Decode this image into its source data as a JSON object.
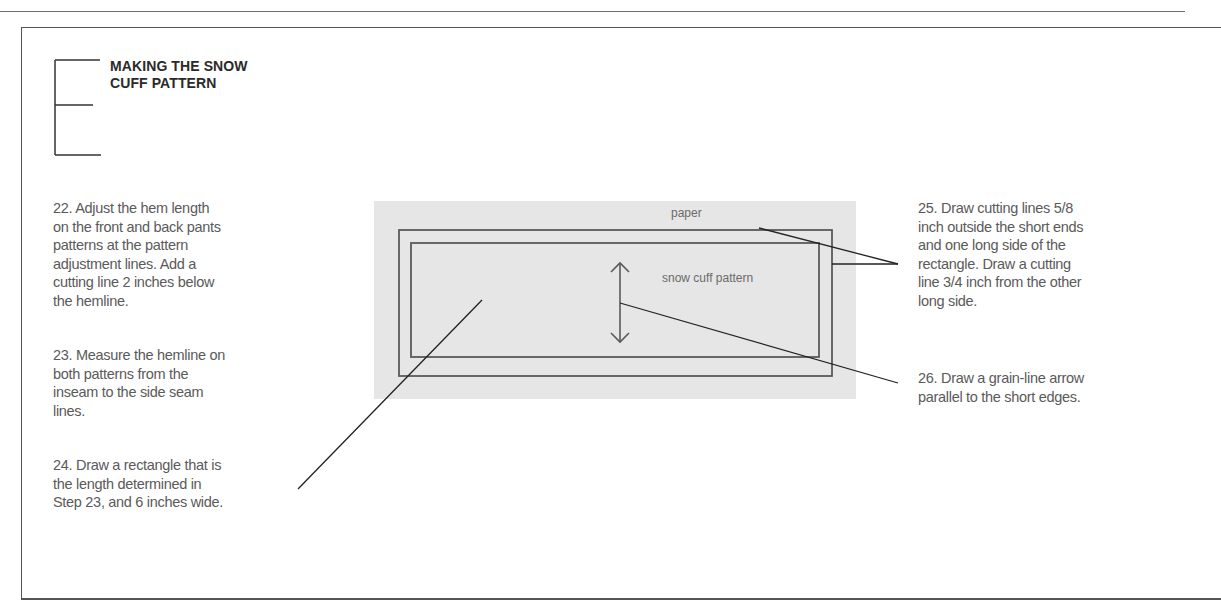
{
  "section": {
    "heading_line1": "MAKING THE SNOW",
    "heading_line2": "CUFF PATTERN"
  },
  "steps": [
    {
      "number": "22",
      "text_lines": [
        "22. Adjust the hem length",
        "on the front and back pants",
        "patterns at the pattern",
        "adjustment lines. Add a",
        "cutting line 2 inches below",
        "the hemline."
      ]
    },
    {
      "number": "23",
      "text_lines": [
        "23. Measure the hemline on",
        "both patterns from the",
        "inseam to the side seam",
        "lines."
      ]
    },
    {
      "number": "24",
      "text_lines": [
        "24. Draw a rectangle that is",
        "the length determined in",
        "Step 23, and 6 inches wide."
      ]
    },
    {
      "number": "25",
      "text_lines": [
        "25. Draw cutting lines 5/8",
        "inch outside the short ends",
        "and one long side of the",
        "rectangle. Draw a cutting",
        "line 3/4 inch from the other",
        "long side."
      ]
    },
    {
      "number": "26",
      "text_lines": [
        "26. Draw a grain-line arrow",
        "parallel to the short edges."
      ]
    }
  ],
  "diagram": {
    "paper_label": "paper",
    "pattern_label": "snow cuff pattern",
    "paper_color": "#e6e6e6",
    "line_color": "#555555",
    "grain_arrow_icon": "double-headed-vertical-arrow"
  }
}
